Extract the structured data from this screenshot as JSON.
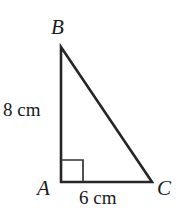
{
  "figure": {
    "kind": "right-triangle-diagram",
    "background_color": "#ffffff",
    "stroke_color": "#262626",
    "text_color": "#1a1a1a",
    "vertices": {
      "A": {
        "label": "A",
        "x": 61,
        "y": 182
      },
      "B": {
        "label": "B",
        "x": 61,
        "y": 47
      },
      "C": {
        "label": "C",
        "x": 152,
        "y": 182
      }
    },
    "sides": {
      "ab": {
        "label": "8 cm",
        "length_value": 8,
        "unit": "cm"
      },
      "ac": {
        "label": "6 cm",
        "length_value": 6,
        "unit": "cm"
      },
      "bc": {
        "label": "",
        "length_value": null,
        "unit": "cm"
      }
    },
    "right_angle": {
      "at_vertex": "A",
      "marker": "square",
      "size": 22
    }
  }
}
